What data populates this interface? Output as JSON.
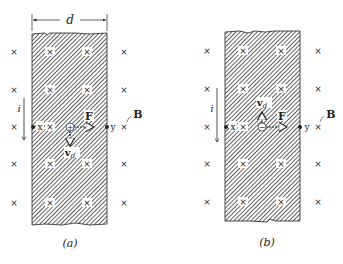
{
  "figure": {
    "dimension_label": "d",
    "current_label": "i",
    "field_label": "B",
    "force_label": "F",
    "drift_velocity_label": "v",
    "drift_velocity_subscript": "d",
    "point_left_label": "x",
    "point_right_label": "y",
    "field_symbol": "×",
    "colors": {
      "ink": "#222222",
      "hatch": "#555555",
      "background": "#ffffff"
    }
  },
  "panels": [
    {
      "id": "a",
      "caption": "(a)",
      "carrier_sign": "+",
      "drift_direction": "down",
      "force_direction": "right"
    },
    {
      "id": "b",
      "caption": "(b)",
      "carrier_sign": "−",
      "drift_direction": "up",
      "force_direction": "right"
    }
  ]
}
